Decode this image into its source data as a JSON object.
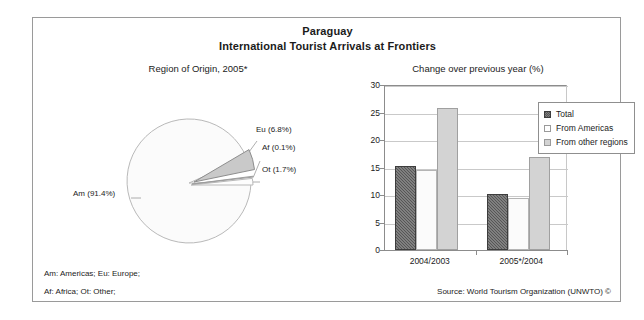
{
  "header": {
    "title": "Paraguay",
    "subtitle": "International Tourist Arrivals at Frontiers"
  },
  "pie_panel": {
    "title": "Region of Origin, 2005*",
    "labels": {
      "eu": "Eu (6.8%)",
      "af": "Af (0.1%)",
      "ot": "Ot (1.7%)",
      "am": "Am (91.4%)"
    }
  },
  "footnotes": {
    "line1": "Am: Americas; Eu: Europe;",
    "line2": "Af: Africa; Ot: Other;",
    "source": "Source: World Tourism Organization (UNWTO) ©"
  },
  "bar_panel": {
    "title": "Change over previous year (%)",
    "legend": [
      {
        "label": "Total",
        "swatch": "dark-hatch"
      },
      {
        "label": "From Americas",
        "swatch": "white"
      },
      {
        "label": "From other regions",
        "swatch": "light-gray"
      }
    ]
  },
  "chart_data": [
    {
      "type": "pie",
      "title": "Region of Origin, 2005*",
      "labels": [
        "Am (91.4%)",
        "Eu (6.8%)",
        "Af (0.1%)",
        "Ot (1.7%)"
      ],
      "categories": [
        "Am",
        "Eu",
        "Af",
        "Ot"
      ],
      "values": [
        91.4,
        6.8,
        0.1,
        1.7
      ],
      "colors": [
        "#fbfbfb",
        "#c9c9c9",
        "#efefef",
        "#fdfdfd"
      ],
      "exploded": [
        "Eu",
        "Af"
      ],
      "legend": "labels-outside"
    },
    {
      "type": "bar",
      "title": "Change over previous year (%)",
      "categories": [
        "2004/2003",
        "2005*/2004"
      ],
      "series": [
        {
          "name": "Total",
          "values": [
            15.3,
            10.2
          ]
        },
        {
          "name": "From Americas",
          "values": [
            14.6,
            9.5
          ]
        },
        {
          "name": "From other regions",
          "values": [
            25.9,
            17.0
          ]
        }
      ],
      "xlabel": "",
      "ylabel": "",
      "ylim": [
        0,
        30
      ],
      "yticks": [
        0,
        5,
        10,
        15,
        20,
        25,
        30
      ],
      "grid": true,
      "legend_position": "top-right"
    }
  ]
}
